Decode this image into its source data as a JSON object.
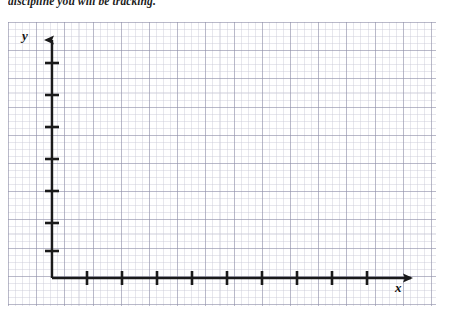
{
  "worksheet": {
    "prompt": "discipline you will be tracking."
  },
  "graph": {
    "y_axis_label": "y",
    "x_axis_label": "x",
    "origin": {
      "x": 52,
      "y": 278
    },
    "axis_color": "#1a1a1a",
    "grid_minor_color": "#9696af",
    "grid_major_color": "#7878a0",
    "y_axis": {
      "top": 32,
      "bottom": 278,
      "tick_count": 7,
      "tick_positions": [
        63,
        95,
        127,
        159,
        191,
        223,
        251
      ],
      "tick_half_width": 7,
      "arrow": "up"
    },
    "x_axis": {
      "left": 52,
      "right": 419,
      "tick_count": 9,
      "tick_positions": [
        87,
        122,
        157,
        192,
        227,
        262,
        297,
        332,
        367
      ],
      "tick_half_height": 7,
      "arrow": "right"
    }
  }
}
